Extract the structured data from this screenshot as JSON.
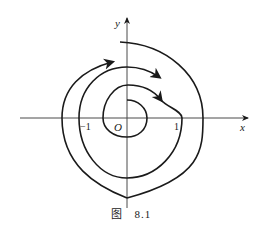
{
  "figure": {
    "caption_prefix": "图",
    "caption_number": "8.1"
  },
  "axes": {
    "x_label": "x",
    "y_label": "y",
    "origin_label": "O",
    "tick_neg_one": "−1",
    "tick_pos_one": "1"
  },
  "diagram": {
    "type": "phase-portrait-spiral",
    "stroke_color": "#1a1a1a",
    "axis_color": "#4a4a4a"
  }
}
